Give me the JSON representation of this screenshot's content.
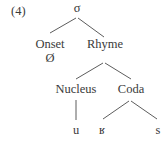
{
  "example_number": "(4)",
  "tree": {
    "root": "σ",
    "onset": "Onset",
    "onset_value": "Ø",
    "rhyme": "Rhyme",
    "nucleus": "Nucleus",
    "coda": "Coda",
    "nucleus_segment": "u",
    "coda_segments": [
      "ʁ",
      "s"
    ]
  }
}
